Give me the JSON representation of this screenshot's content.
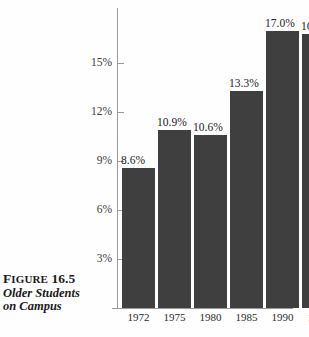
{
  "figure": {
    "clipped_title_fragment": "Older Students on Campus",
    "caption": {
      "line1_lead": "F",
      "line1_rest": "IGURE",
      "line1_number": " 16.5",
      "line2": "Older Students",
      "line3": "on Campus"
    }
  },
  "colors": {
    "bar": "#3f3f3f",
    "axis": "#9a9a9a",
    "text": "#222222",
    "background": "#fefefe"
  },
  "chart_data": {
    "type": "bar",
    "title": "Older Students on Campus",
    "xlabel": "",
    "ylabel": "",
    "categories": [
      "1972",
      "1975",
      "1980",
      "1985",
      "1990",
      "1992"
    ],
    "values": [
      8.6,
      10.9,
      10.6,
      13.3,
      17.0,
      16.8
    ],
    "value_labels": [
      "8.6%",
      "10.9%",
      "10.6%",
      "13.3%",
      "17.0%",
      "16.8%"
    ],
    "ytick_labels": [
      "15%",
      "12%",
      "9%",
      "6%",
      "3%"
    ],
    "ytick_values": [
      15,
      12,
      9,
      6,
      3
    ],
    "ylim": [
      0,
      18.4
    ],
    "grid": false,
    "legend": "none"
  }
}
